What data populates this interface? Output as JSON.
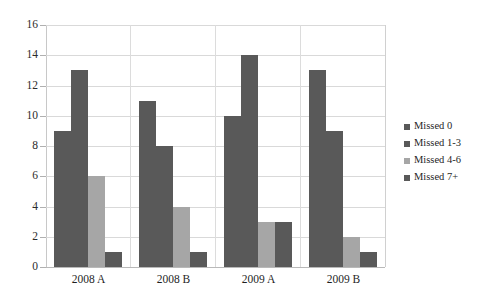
{
  "chart_data": {
    "type": "bar",
    "title": "",
    "xlabel": "",
    "ylabel": "",
    "ylim": [
      0,
      16
    ],
    "ytick_step": 2,
    "yticks": [
      16,
      14,
      12,
      10,
      8,
      6,
      4,
      2,
      0
    ],
    "grid": true,
    "legend_position": "right",
    "categories": [
      "2008 A",
      "2008 B",
      "2009 A",
      "2009 B"
    ],
    "series": [
      {
        "name": "Missed 0",
        "color": "#595959",
        "values": [
          9,
          11,
          10,
          13
        ]
      },
      {
        "name": "Missed 1-3",
        "color": "#595959",
        "values": [
          13,
          8,
          14,
          9
        ]
      },
      {
        "name": "Missed 4-6",
        "color": "#a6a6a6",
        "values": [
          6,
          4,
          3,
          2
        ]
      },
      {
        "name": "Missed 7+",
        "color": "#595959",
        "values": [
          1,
          1,
          3,
          1
        ]
      }
    ]
  },
  "colors": {
    "bar_dark": "#595959",
    "bar_light": "#a6a6a6",
    "gridline": "#d9d9d9",
    "axis": "#c8c8c8",
    "text": "#1f1f1f",
    "background": "#ffffff"
  },
  "artifacts": {
    "top_sliver_text": ""
  }
}
